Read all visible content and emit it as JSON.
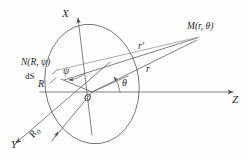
{
  "figure": {
    "type": "geometry-diagram",
    "background_color": "#fdfdfd",
    "stroke_color": "#5a5a5a",
    "text_color": "#2b2b2b"
  },
  "axes": {
    "x_label": "X",
    "y_label": "Y",
    "z_label": "Z",
    "origin_label": "O"
  },
  "points": {
    "source_point_label": "N(R, ψ)",
    "field_point_label": "M(r, θ)"
  },
  "segments": {
    "r_prime_label": "r′",
    "r_label": "r",
    "radius_label": "R",
    "disk_radius_label": "R",
    "disk_radius_subscript": "0",
    "area_element_label": "dS"
  },
  "angles": {
    "theta_label": "θ",
    "psi_label": "ψ"
  },
  "geometry": {
    "origin": {
      "x": 92,
      "y": 92
    },
    "ellipse": {
      "cx": 92,
      "cy": 84,
      "rx": 47,
      "ry": 60,
      "rotation_deg": -8
    },
    "x_axis_tip": {
      "x": 82,
      "y": 14
    },
    "y_axis_tip": {
      "x": 12,
      "y": 146
    },
    "z_axis_tip": {
      "x": 237,
      "y": 92
    },
    "point_N": {
      "x": 62,
      "y": 77
    },
    "point_M": {
      "x": 200,
      "y": 36
    }
  }
}
